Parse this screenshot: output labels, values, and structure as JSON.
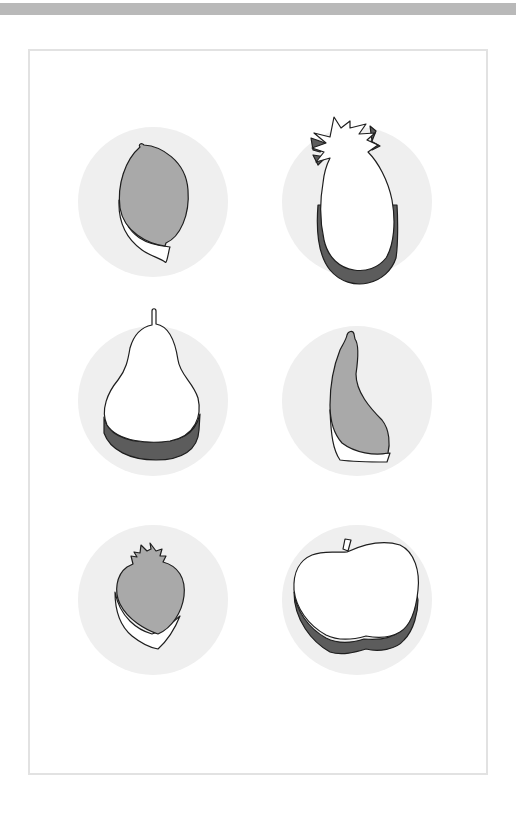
{
  "page": {
    "title": "Fruit shapes",
    "colors": {
      "top_band": "#b9b9b9",
      "frame_border": "#e2e2e2",
      "circle_bg": "#efefef",
      "fruit_fill_gray": "#a9a9a9",
      "fruit_fill_white": "#ffffff",
      "shadow_dark": "#5c5c5c",
      "outline": "#1e1e1e"
    }
  },
  "fruits": [
    {
      "name": "lemon",
      "row": 1,
      "col": 1,
      "fill": "gray",
      "side": "white"
    },
    {
      "name": "pineapple",
      "row": 1,
      "col": 2,
      "fill": "white",
      "side": "dark"
    },
    {
      "name": "pear",
      "row": 2,
      "col": 1,
      "fill": "white",
      "side": "dark"
    },
    {
      "name": "banana",
      "row": 2,
      "col": 2,
      "fill": "gray",
      "side": "white"
    },
    {
      "name": "strawberry",
      "row": 3,
      "col": 1,
      "fill": "gray",
      "side": "white"
    },
    {
      "name": "apple",
      "row": 3,
      "col": 2,
      "fill": "white",
      "side": "dark"
    }
  ]
}
